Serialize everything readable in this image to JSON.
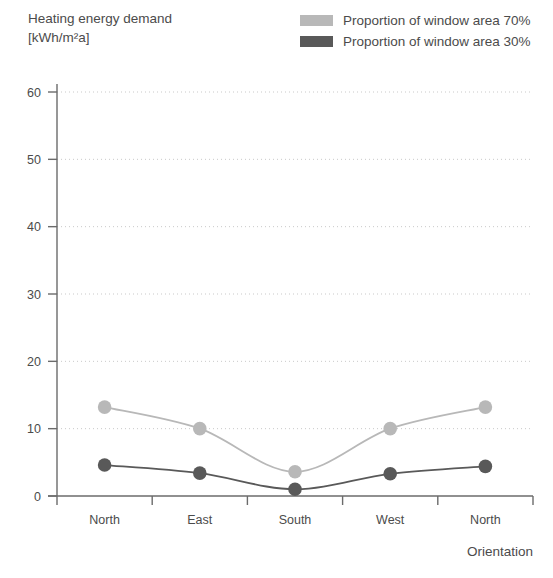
{
  "title": {
    "line1": "Heating energy demand",
    "line2": "[kWh/m²a]"
  },
  "legend": {
    "items": [
      {
        "label": "Proportion of window area 70%",
        "color": "#b8b8b8"
      },
      {
        "label": "Proportion of window area 30%",
        "color": "#595959"
      }
    ]
  },
  "axes": {
    "x_name": "Orientation",
    "y_ticks": [
      "0",
      "10",
      "20",
      "30",
      "40",
      "50",
      "60"
    ],
    "x_ticks": [
      "North",
      "East",
      "South",
      "West",
      "North"
    ]
  },
  "chart_data": {
    "type": "line",
    "title": "Heating energy demand [kWh/m²a]",
    "xlabel": "Orientation",
    "ylabel": "Heating energy demand [kWh/m²a]",
    "categories": [
      "North",
      "East",
      "South",
      "West",
      "North"
    ],
    "series": [
      {
        "name": "Proportion of window area 70%",
        "color": "#b8b8b8",
        "values": [
          13.2,
          10.0,
          3.6,
          10.0,
          13.2
        ]
      },
      {
        "name": "Proportion of window area 30%",
        "color": "#595959",
        "values": [
          4.6,
          3.4,
          1.0,
          3.3,
          4.4
        ]
      }
    ],
    "ylim": [
      0,
      62
    ],
    "yticks": [
      0,
      10,
      20,
      30,
      40,
      50,
      60
    ],
    "grid": "horizontal-dotted",
    "legend_position": "top-right",
    "markers": "circle",
    "interpolation": "smooth"
  }
}
